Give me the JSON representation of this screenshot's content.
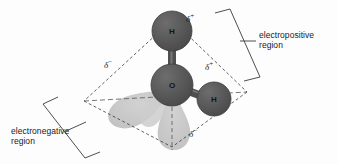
{
  "figure": {
    "background_color": "#fdfdfd",
    "atom_color": "#585858",
    "atom_stroke_color": "#3d3d3d",
    "lobe_color": "#c9c9c9",
    "line_color": "#3a3a3a"
  },
  "atoms": [
    {
      "id": "h-top",
      "label": "H",
      "element": "hydrogen",
      "cx": 172,
      "cy": 31,
      "r": 20
    },
    {
      "id": "o-center",
      "label": "O",
      "element": "oxygen",
      "cx": 172,
      "cy": 85,
      "r": 21
    },
    {
      "id": "h-right",
      "label": "H",
      "element": "hydrogen",
      "cx": 214,
      "cy": 99,
      "r": 17
    }
  ],
  "charges": [
    {
      "id": "delta-plus-top",
      "symbol": "δ",
      "sign": "+",
      "x": 186,
      "y": 18
    },
    {
      "id": "delta-plus-right",
      "symbol": "δ",
      "sign": "+",
      "x": 206,
      "y": 66
    },
    {
      "id": "delta-minus-left",
      "symbol": "δ",
      "sign": "−",
      "x": 106,
      "y": 64
    },
    {
      "id": "delta-minus-bottom",
      "symbol": "δ",
      "sign": "−",
      "x": 190,
      "y": 133
    }
  ],
  "annotations": [
    {
      "id": "electropositive",
      "line1": "electropositive",
      "line2": "region",
      "x": 260,
      "y": 30
    },
    {
      "id": "electronegative",
      "line1": "electronegative",
      "line2": "region",
      "x": 12,
      "y": 128
    }
  ]
}
